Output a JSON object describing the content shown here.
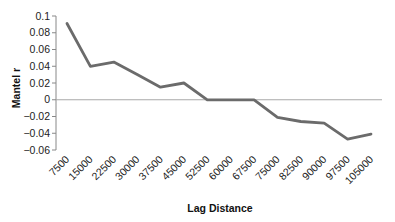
{
  "chart_data": {
    "type": "line",
    "title": "",
    "xlabel": "Lag Distance",
    "ylabel": "Mantel r",
    "categories": [
      "7500",
      "15000",
      "22500",
      "30000",
      "37500",
      "45000",
      "52500",
      "60000",
      "67500",
      "75000",
      "82500",
      "90000",
      "97500",
      "105000"
    ],
    "series": [
      {
        "name": "Mantel r",
        "values": [
          0.091,
          0.04,
          0.045,
          0.03,
          0.015,
          0.02,
          0.0,
          0.0,
          0.0,
          -0.021,
          -0.026,
          -0.028,
          -0.047,
          -0.041
        ]
      }
    ],
    "ylim": [
      -0.06,
      0.1
    ],
    "yticks": [
      0.1,
      0.08,
      0.06,
      0.04,
      0.02,
      0,
      -0.02,
      -0.04,
      -0.06
    ],
    "ytick_labels": [
      "0.1",
      "0.08",
      "0.06",
      "0.04",
      "0.02",
      "0",
      "−0.02",
      "−0.04",
      "−0.06"
    ],
    "grid": false,
    "legend": "none",
    "zero_line": true
  },
  "colors": {
    "line": "#6b6b6b",
    "zero_line": "#a8a8a8",
    "axis": "#888888"
  }
}
